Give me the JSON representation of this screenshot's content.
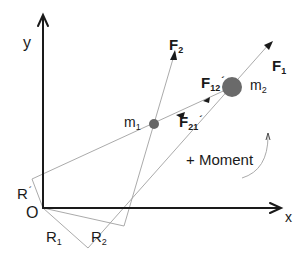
{
  "diagram": {
    "axes": {
      "x_label": "x",
      "y_label": "y",
      "origin_label": "O"
    },
    "masses": [
      {
        "name": "m",
        "sub": "1"
      },
      {
        "name": "m",
        "sub": "2"
      }
    ],
    "forces": {
      "f1": {
        "name": "F",
        "sub": "1"
      },
      "f2": {
        "name": "F",
        "sub": "2"
      },
      "f12": {
        "name": "F",
        "sub": "12",
        "prime": "´"
      },
      "f21": {
        "name": "F",
        "sub": "21",
        "prime": "´"
      }
    },
    "position_vectors": {
      "r1": {
        "name": "R",
        "sub": "1"
      },
      "r2": {
        "name": "R",
        "sub": "2"
      },
      "r_prime": {
        "name": "R",
        "prime": "´"
      }
    },
    "moment_label": "+ Moment",
    "colors": {
      "axis": "#1a1a1a",
      "thin_line": "#9a9a9a",
      "mass_fill": "#666666",
      "text": "#1a1a1a"
    }
  }
}
